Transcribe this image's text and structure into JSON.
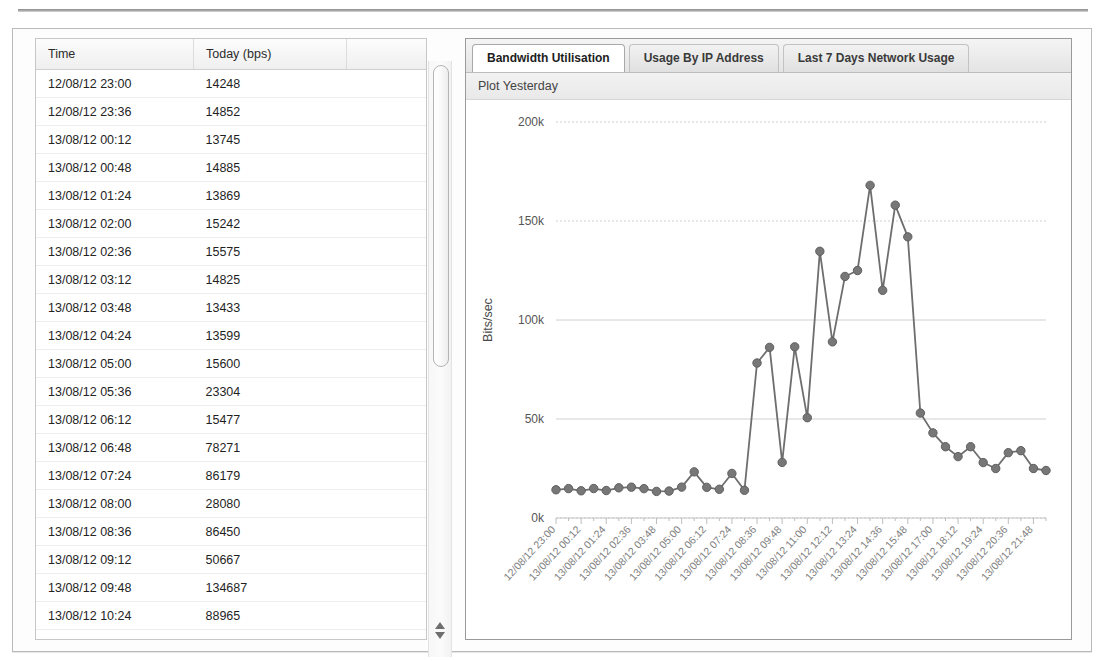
{
  "panel": {
    "table": {
      "columns": [
        "Time",
        "Today (bps)",
        ""
      ],
      "rows": [
        {
          "time": "12/08/12 23:00",
          "value": "14248"
        },
        {
          "time": "12/08/12 23:36",
          "value": "14852"
        },
        {
          "time": "13/08/12 00:12",
          "value": "13745"
        },
        {
          "time": "13/08/12 00:48",
          "value": "14885"
        },
        {
          "time": "13/08/12 01:24",
          "value": "13869"
        },
        {
          "time": "13/08/12 02:00",
          "value": "15242"
        },
        {
          "time": "13/08/12 02:36",
          "value": "15575"
        },
        {
          "time": "13/08/12 03:12",
          "value": "14825"
        },
        {
          "time": "13/08/12 03:48",
          "value": "13433"
        },
        {
          "time": "13/08/12 04:24",
          "value": "13599"
        },
        {
          "time": "13/08/12 05:00",
          "value": "15600"
        },
        {
          "time": "13/08/12 05:36",
          "value": "23304"
        },
        {
          "time": "13/08/12 06:12",
          "value": "15477"
        },
        {
          "time": "13/08/12 06:48",
          "value": "78271"
        },
        {
          "time": "13/08/12 07:24",
          "value": "86179"
        },
        {
          "time": "13/08/12 08:00",
          "value": "28080"
        },
        {
          "time": "13/08/12 08:36",
          "value": "86450"
        },
        {
          "time": "13/08/12 09:12",
          "value": "50667"
        },
        {
          "time": "13/08/12 09:48",
          "value": "134687"
        },
        {
          "time": "13/08/12 10:24",
          "value": "88965"
        }
      ]
    },
    "scrollbar": {
      "up_arrow": "up-arrow",
      "down_arrow": "down-arrow"
    },
    "tabs": [
      {
        "label": "Bandwidth Utilisation",
        "active": true
      },
      {
        "label": "Usage By IP Address",
        "active": false
      },
      {
        "label": "Last 7 Days Network Usage",
        "active": false
      }
    ],
    "subheader": "Plot Yesterday"
  },
  "chart_data": {
    "type": "line",
    "title": "",
    "xlabel": "",
    "ylabel": "Bits/sec",
    "ylim": [
      0,
      200000
    ],
    "yticks": [
      0,
      50000,
      100000,
      150000,
      200000
    ],
    "ytick_labels": [
      "0k",
      "50k",
      "100k",
      "150k",
      "200k"
    ],
    "grid": true,
    "legend": "none",
    "marker": "circle",
    "series_color": "#6e6e6e",
    "x": [
      "12/08/12 23:00",
      "12/08/12 23:36",
      "13/08/12 00:12",
      "13/08/12 00:48",
      "13/08/12 01:24",
      "13/08/12 02:00",
      "13/08/12 02:36",
      "13/08/12 03:12",
      "13/08/12 03:48",
      "13/08/12 04:24",
      "13/08/12 05:00",
      "13/08/12 05:36",
      "13/08/12 06:12",
      "13/08/12 06:48",
      "13/08/12 07:24",
      "13/08/12 08:00",
      "13/08/12 08:36",
      "13/08/12 09:12",
      "13/08/12 09:48",
      "13/08/12 10:24",
      "13/08/12 11:00",
      "13/08/12 11:36",
      "13/08/12 12:12",
      "13/08/12 12:48",
      "13/08/12 13:24",
      "13/08/12 14:00",
      "13/08/12 14:36",
      "13/08/12 15:12",
      "13/08/12 15:48",
      "13/08/12 16:24",
      "13/08/12 17:00",
      "13/08/12 17:36",
      "13/08/12 18:12",
      "13/08/12 18:48",
      "13/08/12 19:24",
      "13/08/12 20:00",
      "13/08/12 20:36",
      "13/08/12 21:12",
      "13/08/12 21:48",
      "13/08/12 22:24"
    ],
    "xtick_labels": [
      "12/08/12 23:00",
      "13/08/12 00:12",
      "13/08/12 01:24",
      "13/08/12 02:36",
      "13/08/12 03:48",
      "13/08/12 05:00",
      "13/08/12 06:12",
      "13/08/12 07:24",
      "13/08/12 08:36",
      "13/08/12 09:48",
      "13/08/12 11:00",
      "13/08/12 12:12",
      "13/08/12 13:24",
      "13/08/12 14:36",
      "13/08/12 15:48",
      "13/08/12 17:00",
      "13/08/12 18:12",
      "13/08/12 19:24",
      "13/08/12 20:36",
      "13/08/12 21:48"
    ],
    "values": [
      14248,
      14852,
      13745,
      14885,
      13869,
      15242,
      15575,
      14825,
      13433,
      13599,
      15600,
      23304,
      15477,
      14500,
      22500,
      14000,
      78271,
      86179,
      28080,
      86450,
      50667,
      134687,
      88965,
      122000,
      125000,
      168000,
      115000,
      158000,
      142000,
      53000,
      43000,
      36000,
      31000,
      36000,
      28000,
      25000,
      33000,
      34000,
      25000,
      24000
    ]
  }
}
